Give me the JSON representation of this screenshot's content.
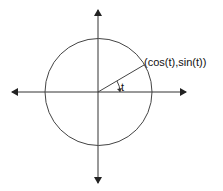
{
  "diagram": {
    "point_label": "(cos(t),sin(t))",
    "angle_label": "t",
    "colors": {
      "stroke": "#333333",
      "background": "#ffffff"
    }
  }
}
